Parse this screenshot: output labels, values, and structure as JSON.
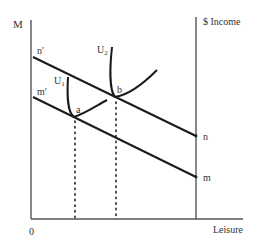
{
  "diagram": {
    "type": "indifference-curve-budget-constraint",
    "labels": {
      "y_axis_left": "M",
      "y_axis_right": "$ Income",
      "x_axis": "Leisure",
      "origin": "0",
      "budget_upper_start": "n′",
      "budget_upper_end": "n",
      "budget_lower_start": "m′",
      "budget_lower_end": "m",
      "curve_low": "U",
      "curve_low_sub": "1",
      "curve_high": "U",
      "curve_high_sub": "2",
      "point_low": "a",
      "point_high": "b"
    },
    "colors": {
      "line": "#1a1a1a",
      "axis": "#555555",
      "text": "#333333"
    }
  }
}
